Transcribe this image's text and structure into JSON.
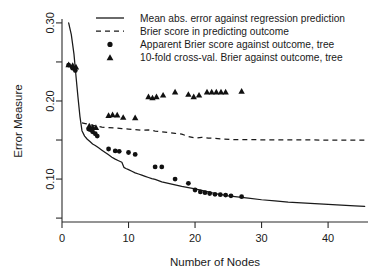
{
  "chart_data": {
    "type": "line",
    "title": "",
    "xlabel": "Number of Nodes",
    "ylabel": "Error Measure",
    "xlim": [
      0,
      46
    ],
    "ylim": [
      0.045,
      0.305
    ],
    "grid": false,
    "legend_position": "top-right",
    "xticks": [
      0,
      10,
      20,
      30,
      40
    ],
    "xtick_labels": [
      "0",
      "10",
      "20",
      "30",
      "40"
    ],
    "yticks": [
      0.1,
      0.2,
      0.3
    ],
    "ytick_labels": [
      "0.10",
      "0.20",
      "0.30"
    ],
    "yticks_minor": [
      0.05,
      0.15,
      0.25
    ],
    "series": [
      {
        "name": "Mean abs. error against regression prediction",
        "style": "solid-line",
        "x": [
          1,
          1.4,
          1.8,
          2.1,
          2.4,
          2.7,
          3,
          3.4,
          3.8,
          4.2,
          4.6,
          5,
          5.5,
          6,
          6.5,
          7,
          7.5,
          8,
          8.5,
          9,
          9.3,
          9.6,
          10,
          10.5,
          11,
          11.5,
          12,
          12.5,
          13,
          13.5,
          14,
          15,
          16,
          17,
          18,
          19,
          20,
          21,
          22,
          23,
          24,
          25,
          26,
          27,
          28,
          30,
          32,
          34,
          36,
          38,
          40,
          42,
          44,
          45.5
        ],
        "y": [
          0.3,
          0.285,
          0.26,
          0.232,
          0.205,
          0.18,
          0.162,
          0.155,
          0.151,
          0.148,
          0.145,
          0.143,
          0.14,
          0.137,
          0.134,
          0.131,
          0.128,
          0.1255,
          0.1235,
          0.1215,
          0.115,
          0.1135,
          0.112,
          0.11,
          0.108,
          0.1065,
          0.105,
          0.1035,
          0.102,
          0.1005,
          0.0995,
          0.0965,
          0.0945,
          0.0925,
          0.0905,
          0.089,
          0.0875,
          0.0855,
          0.0835,
          0.0815,
          0.08,
          0.0785,
          0.0775,
          0.0765,
          0.0755,
          0.0735,
          0.072,
          0.0705,
          0.0695,
          0.0685,
          0.0675,
          0.0665,
          0.0655,
          0.065
        ]
      },
      {
        "name": "Brier score in predicting outcome",
        "style": "dashed-line",
        "x": [
          3,
          3.5,
          4,
          4.5,
          5,
          6,
          7,
          8,
          9,
          10,
          11,
          12,
          13,
          14,
          15,
          16,
          17,
          18,
          19,
          20,
          21,
          22,
          24,
          26,
          28,
          30,
          33,
          36,
          39,
          42,
          45.5
        ],
        "y": [
          0.172,
          0.171,
          0.17,
          0.169,
          0.168,
          0.1665,
          0.166,
          0.1655,
          0.1645,
          0.164,
          0.1635,
          0.1625,
          0.163,
          0.1615,
          0.1605,
          0.1595,
          0.1585,
          0.1575,
          0.1545,
          0.1525,
          0.1535,
          0.1525,
          0.1515,
          0.1505,
          0.1505,
          0.1503,
          0.1502,
          0.1501,
          0.15,
          0.15,
          0.15
        ]
      },
      {
        "name": "Apparent Brier score against outcome, tree",
        "style": "circle-markers",
        "x": [
          1,
          1.6,
          2,
          4,
          4.3,
          4.6,
          5,
          5.3,
          7,
          8,
          8.6,
          10,
          11,
          14,
          15,
          17,
          19,
          20,
          20.8,
          21.5,
          22.2,
          23,
          23.8,
          24.6,
          25.4,
          27
        ],
        "y": [
          0.246,
          0.242,
          0.239,
          0.164,
          0.163,
          0.1605,
          0.158,
          0.155,
          0.1385,
          0.136,
          0.1355,
          0.134,
          0.1315,
          0.1155,
          0.1155,
          0.1,
          0.0945,
          0.086,
          0.0835,
          0.0825,
          0.0815,
          0.0805,
          0.08,
          0.0795,
          0.0785,
          0.0775
        ]
      },
      {
        "name": "10-fold cross-val. Brier against outcome, tree",
        "style": "triangle-markers",
        "x": [
          1,
          1.6,
          2.1,
          4.1,
          4.6,
          5.1,
          7,
          7.6,
          8.3,
          9.2,
          11,
          13,
          13.6,
          14.2,
          15.2,
          17,
          19,
          19.8,
          20.6,
          21.8,
          22.5,
          23.2,
          23.9,
          24.6,
          27
        ],
        "y": [
          0.2465,
          0.2455,
          0.2435,
          0.168,
          0.1665,
          0.166,
          0.1815,
          0.1825,
          0.182,
          0.179,
          0.1785,
          0.2055,
          0.204,
          0.2055,
          0.2075,
          0.2115,
          0.2085,
          0.2055,
          0.2075,
          0.2115,
          0.2115,
          0.2115,
          0.2115,
          0.2115,
          0.2125
        ]
      }
    ]
  },
  "legend": {
    "items": [
      {
        "label": "Mean abs. error against regression prediction",
        "marker": "solid-line"
      },
      {
        "label": "Brier score in predicting outcome",
        "marker": "dashed-line"
      },
      {
        "label": "Apparent Brier score against outcome, tree",
        "marker": "circle-marker"
      },
      {
        "label": "10-fold cross-val. Brier against outcome, tree",
        "marker": "triangle-marker"
      }
    ]
  }
}
